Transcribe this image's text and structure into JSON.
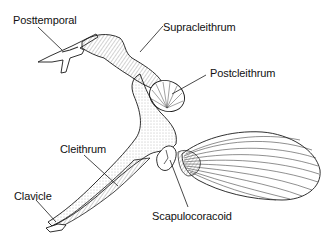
{
  "diagram": {
    "labels": {
      "posttemporal": "Posttemporal",
      "supracleithrum": "Supracleithrum",
      "postcleithrum": "Postcleithrum",
      "cleithrum": "Cleithrum",
      "clavicle": "Clavicle",
      "scapulocoracoid": "Scapulocoracoid"
    },
    "colors": {
      "ink": "#1a1a1a",
      "background": "#ffffff",
      "stipple": "#555555"
    }
  }
}
